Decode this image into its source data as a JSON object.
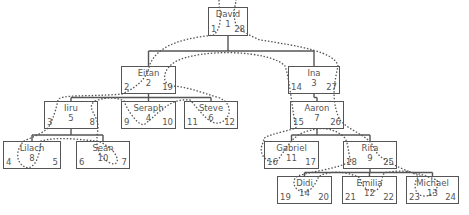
{
  "diagram": {
    "type": "tree",
    "nodes": [
      {
        "key": "david",
        "name": "David",
        "id": "1",
        "left": "1",
        "right": "28",
        "x": 208,
        "y": 7,
        "w": 40,
        "h": 29
      },
      {
        "key": "eitan",
        "name": "Eitan",
        "id": "2",
        "left": "2",
        "right": "19",
        "x": 121,
        "y": 66,
        "w": 55,
        "h": 28
      },
      {
        "key": "ina",
        "name": "Ina",
        "id": "3",
        "left": "14",
        "right": "27",
        "x": 288,
        "y": 66,
        "w": 52,
        "h": 28
      },
      {
        "key": "iiru",
        "name": "Iiru",
        "id": "5",
        "left": "3",
        "right": "8",
        "x": 44,
        "y": 101,
        "w": 54,
        "h": 28
      },
      {
        "key": "seraph",
        "name": "Seraph",
        "id": "4",
        "left": "9",
        "right": "10",
        "x": 121,
        "y": 101,
        "w": 55,
        "h": 28
      },
      {
        "key": "steve",
        "name": "Steve",
        "id": "6",
        "left": "11",
        "right": "12",
        "x": 184,
        "y": 101,
        "w": 54,
        "h": 28
      },
      {
        "key": "aaron",
        "name": "Aaron",
        "id": "7",
        "left": "15",
        "right": "26",
        "x": 290,
        "y": 101,
        "w": 54,
        "h": 28
      },
      {
        "key": "lilach",
        "name": "Lilach",
        "id": "8",
        "left": "4",
        "right": "5",
        "x": 3,
        "y": 141,
        "w": 58,
        "h": 28
      },
      {
        "key": "sean",
        "name": "Sean",
        "id": "10",
        "left": "6",
        "right": "7",
        "x": 76,
        "y": 141,
        "w": 54,
        "h": 28
      },
      {
        "key": "gabriel",
        "name": "Gabriel",
        "id": "11",
        "left": "16",
        "right": "17",
        "x": 264,
        "y": 141,
        "w": 55,
        "h": 28
      },
      {
        "key": "rita",
        "name": "Rita",
        "id": "9",
        "left": "18",
        "right": "25",
        "x": 343,
        "y": 141,
        "w": 54,
        "h": 28
      },
      {
        "key": "didi",
        "name": "Didi",
        "id": "14",
        "left": "19",
        "right": "20",
        "x": 277,
        "y": 176,
        "w": 55,
        "h": 28
      },
      {
        "key": "emilia",
        "name": "Emilia",
        "id": "12",
        "left": "21",
        "right": "22",
        "x": 342,
        "y": 176,
        "w": 55,
        "h": 28
      },
      {
        "key": "michael",
        "name": "Michael",
        "id": "13",
        "left": "23",
        "right": "24",
        "x": 406,
        "y": 176,
        "w": 53,
        "h": 28
      }
    ],
    "edges": [
      [
        "david",
        "eitan"
      ],
      [
        "david",
        "ina"
      ],
      [
        "eitan",
        "iiru"
      ],
      [
        "eitan",
        "seraph"
      ],
      [
        "eitan",
        "steve"
      ],
      [
        "ina",
        "aaron"
      ],
      [
        "iiru",
        "lilach"
      ],
      [
        "iiru",
        "sean"
      ],
      [
        "aaron",
        "gabriel"
      ],
      [
        "aaron",
        "rita"
      ],
      [
        "rita",
        "didi"
      ],
      [
        "rita",
        "emilia"
      ],
      [
        "rita",
        "michael"
      ]
    ],
    "colors": {
      "box_border": "#555555",
      "text": "#555555",
      "traversal": "#555555"
    }
  }
}
